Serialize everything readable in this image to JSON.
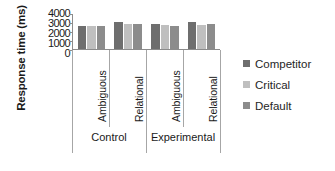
{
  "chart_data": {
    "type": "bar",
    "title": "",
    "xlabel": "",
    "ylabel": "Response time (ms)",
    "ylim": [
      0,
      4000
    ],
    "yticks": [
      0,
      1000,
      2000,
      3000,
      4000
    ],
    "ytick_labels": [
      "0",
      "1000",
      "2000",
      "3000",
      "4000"
    ],
    "grid": false,
    "legend_position": "right",
    "categories": [
      "Ambiguous",
      "Relational",
      "Ambiguous",
      "Relational"
    ],
    "group_labels": [
      "Control",
      "Experimental"
    ],
    "series": [
      {
        "name": "Competitor",
        "color": "#6e6e6e",
        "values": [
          2550,
          2950,
          2750,
          2900
        ]
      },
      {
        "name": "Critical",
        "color": "#bfbfbf",
        "values": [
          2500,
          2750,
          2650,
          2650
        ]
      },
      {
        "name": "Default",
        "color": "#8c8c8c",
        "values": [
          2500,
          2700,
          2450,
          2750
        ]
      }
    ]
  },
  "axis": {
    "y_title": "Response time (ms)",
    "tick_labels": [
      "4000",
      "3000",
      "2000",
      "1000",
      "0"
    ]
  },
  "categories": [
    {
      "label": "Ambiguous"
    },
    {
      "label": "Relational"
    },
    {
      "label": "Ambiguous"
    },
    {
      "label": "Relational"
    }
  ],
  "groups": [
    {
      "label": "Control"
    },
    {
      "label": "Experimental"
    }
  ],
  "legend": [
    {
      "label": "Competitor",
      "color": "#6e6e6e"
    },
    {
      "label": "Critical",
      "color": "#bfbfbf"
    },
    {
      "label": "Default",
      "color": "#8c8c8c"
    }
  ]
}
